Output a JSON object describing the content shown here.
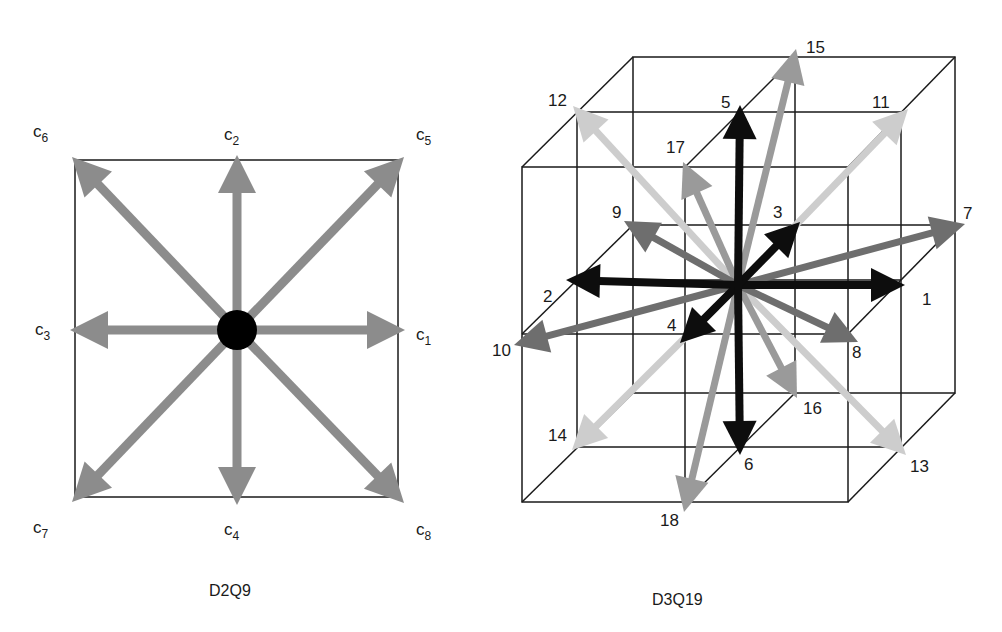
{
  "figure": {
    "panels": [
      {
        "id": "d2q9",
        "caption": "D2Q9",
        "center": [
          237,
          330
        ],
        "center_dot_color": "#000000",
        "arrow_color": "#8c8c8c",
        "box": {
          "x1": 75,
          "y1": 160,
          "x2": 398,
          "y2": 497
        },
        "vectors": [
          {
            "name": "c",
            "sub": "1",
            "tip": [
              405,
              330
            ],
            "label_pos": [
              416,
              340
            ]
          },
          {
            "name": "c",
            "sub": "2",
            "tip": [
              237,
              155
            ],
            "label_pos": [
              224,
              140
            ]
          },
          {
            "name": "c",
            "sub": "3",
            "tip": [
              70,
              330
            ],
            "label_pos": [
              35,
              340
            ]
          },
          {
            "name": "c",
            "sub": "4",
            "tip": [
              237,
              505
            ],
            "label_pos": [
              224,
              538
            ]
          },
          {
            "name": "c",
            "sub": "5",
            "tip": [
              404,
              157
            ],
            "label_pos": [
              416,
              142
            ]
          },
          {
            "name": "c",
            "sub": "6",
            "tip": [
              72,
              157
            ],
            "label_pos": [
              35,
              142
            ]
          },
          {
            "name": "c",
            "sub": "7",
            "tip": [
              72,
              502
            ],
            "label_pos": [
              35,
              538
            ]
          },
          {
            "name": "c",
            "sub": "8",
            "tip": [
              404,
              503
            ],
            "label_pos": [
              416,
              540
            ]
          }
        ]
      },
      {
        "id": "d3q19",
        "caption": "D3Q19",
        "center": [
          738,
          285
        ],
        "colors": {
          "axis": "#0d0d0d",
          "edge_in_plane": "#6e6e6e",
          "edge_face_diag": "#cdcdcd",
          "edge_vertical_diag": "#9a9a9a"
        },
        "vectors": [
          {
            "label": "1",
            "tip": [
              905,
              285
            ],
            "color": "axis",
            "label_pos": [
              922,
              305
            ]
          },
          {
            "label": "2",
            "tip": [
              566,
              280
            ],
            "color": "axis",
            "label_pos": [
              543,
              302
            ]
          },
          {
            "label": "3",
            "tip": [
              800,
              222
            ],
            "color": "axis",
            "label_pos": [
              773,
              218
            ]
          },
          {
            "label": "4",
            "tip": [
              680,
              343
            ],
            "color": "axis",
            "label_pos": [
              667,
              331
            ]
          },
          {
            "label": "5",
            "tip": [
              740,
              105
            ],
            "color": "axis",
            "label_pos": [
              721,
              108
            ]
          },
          {
            "label": "6",
            "tip": [
              740,
              455
            ],
            "color": "axis",
            "label_pos": [
              744,
              470
            ]
          },
          {
            "label": "7",
            "tip": [
              965,
              224
            ],
            "color": "edge_in_plane",
            "label_pos": [
              963,
              219
            ]
          },
          {
            "label": "8",
            "tip": [
              858,
              342
            ],
            "color": "edge_in_plane",
            "label_pos": [
              852,
              358
            ]
          },
          {
            "label": "9",
            "tip": [
              624,
              221
            ],
            "color": "edge_in_plane",
            "label_pos": [
              612,
              218
            ]
          },
          {
            "label": "10",
            "tip": [
              514,
              345
            ],
            "color": "edge_in_plane",
            "label_pos": [
              492,
              356
            ]
          },
          {
            "label": "11",
            "tip": [
              908,
              109
            ],
            "color": "edge_face_diag",
            "label_pos": [
              872,
              108
            ]
          },
          {
            "label": "12",
            "tip": [
              573,
              106
            ],
            "color": "edge_face_diag",
            "label_pos": [
              548,
              106
            ]
          },
          {
            "label": "13",
            "tip": [
              906,
              455
            ],
            "color": "edge_face_diag",
            "label_pos": [
              910,
              472
            ]
          },
          {
            "label": "14",
            "tip": [
              572,
              450
            ],
            "color": "edge_face_diag",
            "label_pos": [
              548,
              441
            ]
          },
          {
            "label": "15",
            "tip": [
              796,
              49
            ],
            "color": "edge_vertical_diag",
            "label_pos": [
              806,
              53
            ]
          },
          {
            "label": "16",
            "tip": [
              797,
              398
            ],
            "color": "edge_vertical_diag",
            "label_pos": [
              803,
              414
            ]
          },
          {
            "label": "17",
            "tip": [
              683,
              162
            ],
            "color": "edge_vertical_diag",
            "label_pos": [
              666,
              153
            ]
          },
          {
            "label": "18",
            "tip": [
              684,
              512
            ],
            "color": "edge_vertical_diag",
            "label_pos": [
              660,
              526
            ]
          }
        ]
      }
    ]
  },
  "captions": {
    "left": "D2Q9",
    "right": "D3Q19"
  },
  "d2q9_labels": {
    "c1": {
      "base": "c",
      "sub": "1"
    },
    "c2": {
      "base": "c",
      "sub": "2"
    },
    "c3": {
      "base": "c",
      "sub": "3"
    },
    "c4": {
      "base": "c",
      "sub": "4"
    },
    "c5": {
      "base": "c",
      "sub": "5"
    },
    "c6": {
      "base": "c",
      "sub": "6"
    },
    "c7": {
      "base": "c",
      "sub": "7"
    },
    "c8": {
      "base": "c",
      "sub": "8"
    }
  },
  "d3q19_labels": {
    "v1": "1",
    "v2": "2",
    "v3": "3",
    "v4": "4",
    "v5": "5",
    "v6": "6",
    "v7": "7",
    "v8": "8",
    "v9": "9",
    "v10": "10",
    "v11": "11",
    "v12": "12",
    "v13": "13",
    "v14": "14",
    "v15": "15",
    "v16": "16",
    "v17": "17",
    "v18": "18"
  }
}
